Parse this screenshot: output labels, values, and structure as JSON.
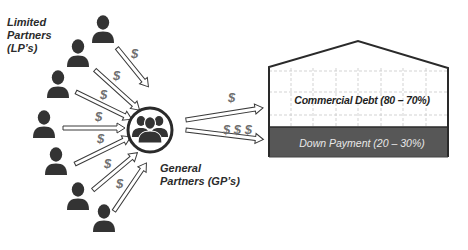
{
  "diagram": {
    "type": "real-estate-syndication-flow",
    "limited_partners": {
      "label_line1": "Limited",
      "label_line2": "Partners",
      "label_line3": "(LP’s)",
      "count": 9,
      "icon": "person-icon"
    },
    "general_partners": {
      "label_line1": "General",
      "label_line2": "Partners (GP’s)",
      "icon": "group-icon"
    },
    "lp_to_gp_arrows": {
      "symbol": "$",
      "count": 9
    },
    "gp_to_property_arrows": [
      {
        "symbol": "$"
      },
      {
        "symbol": "$ $ $"
      }
    ],
    "property": {
      "icon": "building-icon",
      "commercial_debt_label": "Commercial Debt (80 – 70%)",
      "down_payment_label": "Down Payment (20 – 30%)"
    },
    "colors": {
      "icon_fill": "#333333",
      "dollar_text": "#6f6f6f",
      "down_payment_fill": "#575757",
      "grid_line": "#c8c8c8",
      "outline": "#2a2a2a"
    }
  }
}
